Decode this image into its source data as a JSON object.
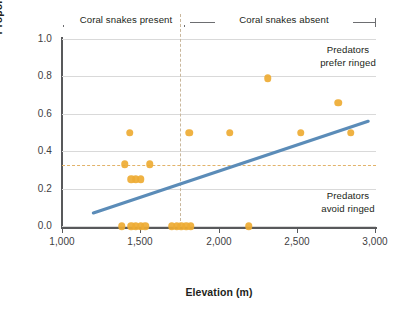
{
  "chart_data": {
    "type": "scatter",
    "title": "",
    "xlabel": "Elevation (m)",
    "ylabel": "Proportion of total attacks on ringed replicas",
    "xlim": [
      1000,
      3000
    ],
    "ylim": [
      0.0,
      1.0
    ],
    "xticks": [
      1000,
      1500,
      2000,
      2500,
      3000
    ],
    "xtick_labels": [
      "1,000",
      "1,500",
      "2,000",
      "2,500",
      "3,000"
    ],
    "yticks": [
      0.0,
      0.2,
      0.4,
      0.6,
      0.8,
      1.0
    ],
    "ytick_labels": [
      "0.0",
      "0.2",
      "0.4",
      "0.6",
      "0.8",
      "1.0"
    ],
    "grid": "horizontal",
    "legend": "none",
    "marker_color": "#eeab33",
    "line_color": "#5b8cb8",
    "reference_line_color": "#e2b36a",
    "divider_color": "#c9b79c",
    "points": [
      {
        "x": 1430,
        "y": 0.5
      },
      {
        "x": 1810,
        "y": 0.5
      },
      {
        "x": 2070,
        "y": 0.5
      },
      {
        "x": 2310,
        "y": 0.79
      },
      {
        "x": 2520,
        "y": 0.5
      },
      {
        "x": 2760,
        "y": 0.66
      },
      {
        "x": 2840,
        "y": 0.5
      },
      {
        "x": 1400,
        "y": 0.33
      },
      {
        "x": 1560,
        "y": 0.33
      },
      {
        "x": 1440,
        "y": 0.25
      },
      {
        "x": 1470,
        "y": 0.25
      },
      {
        "x": 1500,
        "y": 0.25
      },
      {
        "x": 1380,
        "y": 0.0
      },
      {
        "x": 1440,
        "y": 0.0
      },
      {
        "x": 1470,
        "y": 0.0
      },
      {
        "x": 1500,
        "y": 0.0
      },
      {
        "x": 1530,
        "y": 0.0
      },
      {
        "x": 1700,
        "y": 0.0
      },
      {
        "x": 1730,
        "y": 0.0
      },
      {
        "x": 1760,
        "y": 0.0
      },
      {
        "x": 1790,
        "y": 0.0
      },
      {
        "x": 1820,
        "y": 0.0
      },
      {
        "x": 2190,
        "y": 0.0
      }
    ],
    "trend_line": {
      "x0": 1200,
      "y0": 0.07,
      "x1": 2950,
      "y1": 0.56
    },
    "reference_line_y": 0.33,
    "divider_x": 1750,
    "annotations": [
      {
        "id": "top",
        "line1": "Predators",
        "line2": "prefer ringed"
      },
      {
        "id": "bottom",
        "line1": "Predators",
        "line2": "avoid ringed"
      }
    ],
    "brackets": [
      {
        "id": "present",
        "label": "Coral snakes present"
      },
      {
        "id": "absent",
        "label": "Coral snakes absent"
      }
    ]
  }
}
